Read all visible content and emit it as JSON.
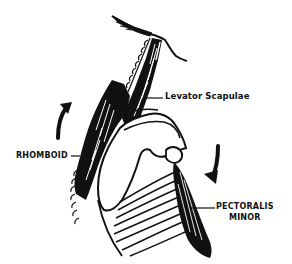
{
  "diagram": {
    "labels": {
      "levator": "Levator Scapulae",
      "rhomboid": "RHOMBOID",
      "pectoralis_line1": "PECTORALIS",
      "pectoralis_line2": "MINOR"
    },
    "arrows": [
      {
        "name": "upward-rotation-arrow",
        "position": "left",
        "direction": "up"
      },
      {
        "name": "downward-rotation-arrow",
        "position": "right",
        "direction": "down"
      }
    ],
    "colors": {
      "ink": "#111111",
      "background": "#ffffff"
    }
  }
}
